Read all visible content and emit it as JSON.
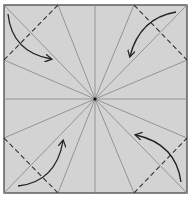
{
  "diagram": {
    "paper_color": "#d3d3d3",
    "border_color": "#555555",
    "crease_color": "#8c8c8c",
    "dash_color": "#333333",
    "arrow_color": "#222222",
    "square": {
      "x": 4,
      "y": 5,
      "width": 183,
      "height": 188
    },
    "center": {
      "x": 95,
      "y": 99
    },
    "radial_endpoints": [
      [
        4,
        5
      ],
      [
        58,
        5
      ],
      [
        95,
        5
      ],
      [
        134,
        5
      ],
      [
        187,
        5
      ],
      [
        187,
        60
      ],
      [
        187,
        99
      ],
      [
        187,
        138
      ],
      [
        187,
        193
      ],
      [
        134,
        193
      ],
      [
        95,
        193
      ],
      [
        58,
        193
      ],
      [
        4,
        193
      ],
      [
        4,
        138
      ],
      [
        4,
        99
      ],
      [
        4,
        60
      ]
    ],
    "valley_folds": [
      {
        "name": "top-left",
        "from": [
          58,
          5
        ],
        "to": [
          4,
          60
        ]
      },
      {
        "name": "top-right",
        "from": [
          134,
          5
        ],
        "to": [
          187,
          60
        ]
      },
      {
        "name": "bottom-left",
        "from": [
          4,
          138
        ],
        "to": [
          58,
          193
        ]
      },
      {
        "name": "bottom-right",
        "from": [
          134,
          193
        ],
        "to": [
          187,
          138
        ]
      }
    ],
    "arrows": [
      {
        "name": "top-left",
        "path": "M 8 14 Q 12 52 51 59",
        "head": [
          51,
          59
        ]
      },
      {
        "name": "top-right",
        "path": "M 176 12 Q 140 18 130 56",
        "head": [
          130,
          56
        ]
      },
      {
        "name": "bottom-left",
        "path": "M 18 186 Q 56 182 63 141",
        "head": [
          63,
          141
        ]
      },
      {
        "name": "bottom-right",
        "path": "M 181 182 Q 176 144 136 135",
        "head": [
          136,
          135
        ]
      }
    ]
  }
}
